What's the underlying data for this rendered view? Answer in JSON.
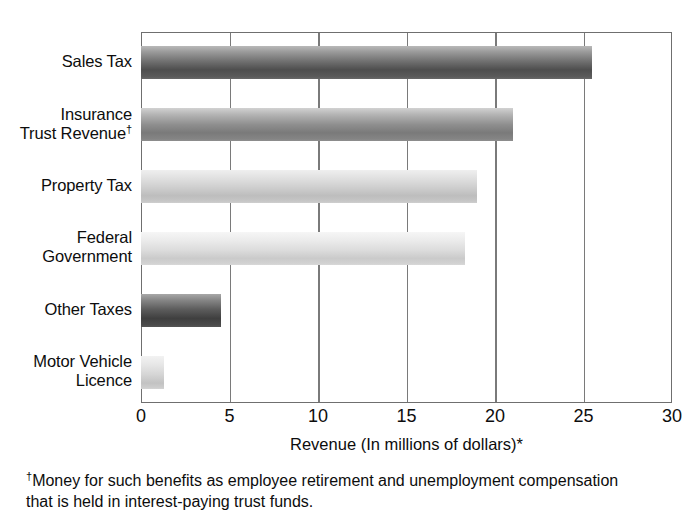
{
  "chart_data": {
    "type": "bar",
    "orientation": "horizontal",
    "title": "",
    "categories": [
      "Sales Tax",
      "Insurance\nTrust Revenue",
      "Property Tax",
      "Federal\nGovernment",
      "Other Taxes",
      "Motor Vehicle\nLicence"
    ],
    "values": [
      25.5,
      21.0,
      19.0,
      18.3,
      4.5,
      1.3
    ],
    "xlabel": "Revenue (In millions of dollars)*",
    "ylabel": "",
    "xlim": [
      0,
      30
    ],
    "xticks": [
      0,
      5,
      10,
      15,
      20,
      25,
      30
    ],
    "xtick_labels": [
      "0",
      "5",
      "10",
      "15",
      "20",
      "25",
      "30"
    ],
    "grid": "vertical",
    "legend": "none",
    "bar_shades": [
      "shade-dark",
      "shade-mid",
      "shade-light",
      "shade-lighter",
      "shade-darkest",
      "shade-pale"
    ],
    "category_footnote_marker": "†",
    "category_footnote_index": 1
  },
  "footnote": {
    "marker": "†",
    "line1": "Money for such benefits as employee retirement and unemployment compensation",
    "line2": "that is held in interest-paying trust funds."
  },
  "colors": {
    "frame": "#6f6f6f",
    "gridline": "#7a7a7a",
    "text": "#0d0d0d",
    "background": "#ffffff"
  }
}
